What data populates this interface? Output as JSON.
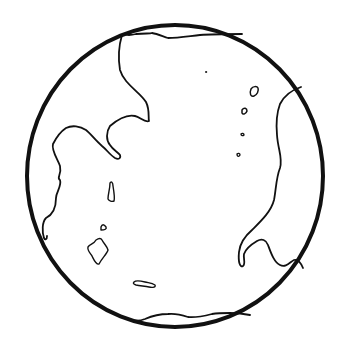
{
  "image": {
    "title": "Globe line drawing",
    "description": "Hand-drawn black outline of a globe with continents and small islands",
    "colors": {
      "background": "#ffffff",
      "stroke": "#111111"
    }
  },
  "globe": {
    "outline": {
      "cx": 175,
      "cy": 176,
      "rx": 148,
      "ry": 151
    },
    "continents": [
      "top-left-landmass",
      "right-landmass",
      "top-polar-cap",
      "bottom-polar-cap"
    ],
    "islands": [
      "island-small-top-right-1",
      "island-small-top-right-2",
      "island-small-top-right-3",
      "island-small-top-right-4",
      "island-left-1",
      "island-left-2",
      "island-left-3",
      "island-bottom"
    ]
  }
}
